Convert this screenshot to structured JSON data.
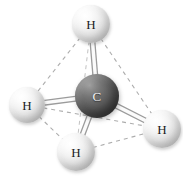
{
  "figure": {
    "molecule_formula": "CH4",
    "geometry": "tetrahedral",
    "background_color": "#ffffff",
    "width": 183,
    "height": 178
  },
  "atoms": [
    {
      "id": "h-top",
      "element": "H",
      "label": "H",
      "cx": 91,
      "cy": 24,
      "r": 19,
      "color": "#e4e4e4",
      "label_color": "#1a1a1a"
    },
    {
      "id": "c-center",
      "element": "C",
      "label": "C",
      "cx": 97,
      "cy": 96,
      "r": 22,
      "color": "#545454",
      "label_color": "#f0f0f0"
    },
    {
      "id": "h-left",
      "element": "H",
      "label": "H",
      "cx": 27,
      "cy": 105,
      "r": 18,
      "color": "#e4e4e4",
      "label_color": "#1a1a1a"
    },
    {
      "id": "h-right",
      "element": "H",
      "label": "H",
      "cx": 162,
      "cy": 129,
      "r": 19,
      "color": "#e4e4e4",
      "label_color": "#1a1a1a"
    },
    {
      "id": "h-bottom",
      "element": "H",
      "label": "H",
      "cx": 76,
      "cy": 152,
      "r": 19,
      "color": "#e4e4e4",
      "label_color": "#1a1a1a"
    }
  ],
  "bonds": [
    {
      "id": "bond-c-h-top",
      "from": "c-center",
      "to": "h-top",
      "style": "solid",
      "color": "#fbfbfb",
      "edge_color": "#9b9b9b",
      "width": 6
    },
    {
      "id": "bond-c-h-left",
      "from": "c-center",
      "to": "h-left",
      "style": "solid",
      "color": "#fbfbfb",
      "edge_color": "#9b9b9b",
      "width": 6
    },
    {
      "id": "bond-c-h-right",
      "from": "c-center",
      "to": "h-right",
      "style": "solid",
      "color": "#fbfbfb",
      "edge_color": "#9b9b9b",
      "width": 6
    },
    {
      "id": "bond-c-h-bottom",
      "from": "c-center",
      "to": "h-bottom",
      "style": "solid",
      "color": "#fbfbfb",
      "edge_color": "#9b9b9b",
      "width": 6
    }
  ],
  "tetrahedron_edges": [
    {
      "id": "edge-top-left",
      "from": "h-top",
      "to": "h-left",
      "style": "dashed",
      "color": "#adadad"
    },
    {
      "id": "edge-top-right",
      "from": "h-top",
      "to": "h-right",
      "style": "dashed",
      "color": "#adadad"
    },
    {
      "id": "edge-top-bottom",
      "from": "h-top",
      "to": "h-bottom",
      "style": "dashed",
      "color": "#c2c2c2"
    },
    {
      "id": "edge-left-right",
      "from": "h-left",
      "to": "h-right",
      "style": "dashed",
      "color": "#adadad"
    },
    {
      "id": "edge-left-bottom",
      "from": "h-left",
      "to": "h-bottom",
      "style": "dashed",
      "color": "#adadad"
    },
    {
      "id": "edge-bottom-right",
      "from": "h-bottom",
      "to": "h-right",
      "style": "dashed",
      "color": "#adadad"
    }
  ]
}
